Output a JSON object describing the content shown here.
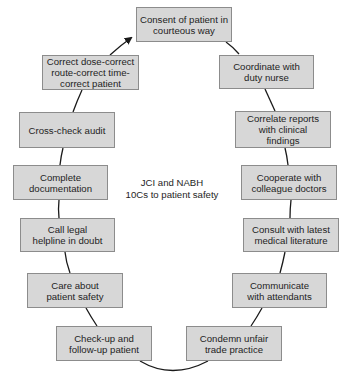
{
  "diagram": {
    "center_title_line1": "JCI and NABH",
    "center_title_line2": "10Cs to patient safety",
    "nodes": [
      {
        "id": "consent",
        "lines": [
          "Consent of patient in",
          "courteous way"
        ]
      },
      {
        "id": "coordinate",
        "lines": [
          "Coordinate with",
          "duty nurse"
        ]
      },
      {
        "id": "correlate",
        "lines": [
          "Correlate reports",
          "with clinical",
          "findings"
        ]
      },
      {
        "id": "cooperate",
        "lines": [
          "Cooperate with",
          "colleague doctors"
        ]
      },
      {
        "id": "consult",
        "lines": [
          "Consult with latest",
          "medical literature"
        ]
      },
      {
        "id": "communicate",
        "lines": [
          "Communicate",
          "with attendants"
        ]
      },
      {
        "id": "condemn",
        "lines": [
          "Condemn unfair",
          "trade practice"
        ]
      },
      {
        "id": "check-up",
        "lines": [
          "Check-up and",
          "follow-up patient"
        ]
      },
      {
        "id": "care",
        "lines": [
          "Care about",
          "patient safety"
        ]
      },
      {
        "id": "call",
        "lines": [
          "Call legal",
          "helpline in doubt"
        ]
      },
      {
        "id": "complete",
        "lines": [
          "Complete",
          "documentation"
        ]
      },
      {
        "id": "cross-check",
        "lines": [
          "Cross-check audit"
        ]
      },
      {
        "id": "correct",
        "lines": [
          "Correct dose-correct",
          "route-correct time-",
          "correct patient"
        ]
      }
    ],
    "colors": {
      "box_fill": "#d7d7d7",
      "box_border": "#8c8c8c",
      "connector": "#1a1a1a",
      "text": "#1e1e1e"
    }
  }
}
